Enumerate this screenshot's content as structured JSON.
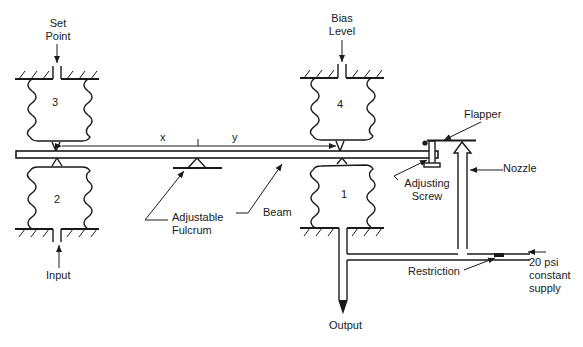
{
  "diagram": {
    "labels": {
      "set_point": [
        "Set",
        "Point"
      ],
      "bias_level": [
        "Bias",
        "Level"
      ],
      "flapper": "Flapper",
      "nozzle": "Nozzle",
      "adjusting_screw": [
        "Adjusting",
        "Screw"
      ],
      "beam": "Beam",
      "adjustable_fulcrum": [
        "Adjustable",
        "Fulcrum"
      ],
      "input": "Input",
      "output": "Output",
      "restriction": "Restriction",
      "supply": [
        "20 psi",
        "constant",
        "supply"
      ],
      "x": "x",
      "y": "y"
    },
    "bellows": [
      {
        "id": "1",
        "position": "lower-right"
      },
      {
        "id": "2",
        "position": "lower-left"
      },
      {
        "id": "3",
        "position": "upper-left"
      },
      {
        "id": "4",
        "position": "upper-right"
      }
    ],
    "colors": {
      "line": "#1a1a1a",
      "background": "#ffffff"
    }
  }
}
